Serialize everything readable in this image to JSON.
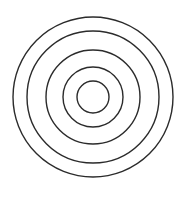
{
  "diagram": {
    "type": "concentric-circles",
    "center": {
      "x": 93,
      "y": 97
    },
    "stroke_color": "#2b2b2b",
    "stroke_width": 1.4,
    "background": "#ffffff",
    "circles": [
      {
        "name": "ring-1",
        "radius": 80
      },
      {
        "name": "ring-2",
        "radius": 66
      },
      {
        "name": "ring-3",
        "radius": 47
      },
      {
        "name": "ring-4",
        "radius": 30
      },
      {
        "name": "ring-5",
        "radius": 16
      }
    ]
  }
}
